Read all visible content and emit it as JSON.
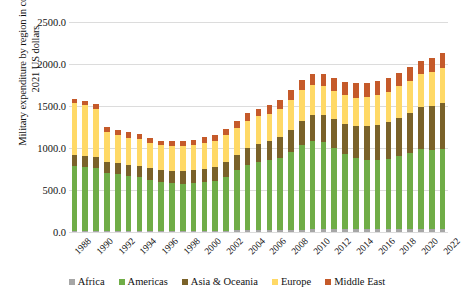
{
  "chart_data": {
    "type": "bar",
    "subtype": "stacked-column",
    "title": "",
    "xlabel": "",
    "ylabel": "Military expenditure by region in constant 2021 US dollars",
    "ylabel_lines": [
      "Military expenditure by region in constant",
      "2021 US dollars"
    ],
    "ylim": [
      0,
      2500
    ],
    "ytick_values": [
      0,
      500,
      1000,
      1500,
      2000,
      2500
    ],
    "ytick_labels": [
      "0.0",
      "500.0",
      "1000.0",
      "1500.0",
      "2000.0",
      "2500.0"
    ],
    "grid": true,
    "legend_position": "bottom",
    "categories": [
      "1988",
      "1989",
      "1990",
      "1991",
      "1992",
      "1993",
      "1994",
      "1995",
      "1996",
      "1997",
      "1998",
      "1999",
      "2000",
      "2001",
      "2002",
      "2003",
      "2004",
      "2005",
      "2006",
      "2007",
      "2008",
      "2009",
      "2010",
      "2011",
      "2012",
      "2013",
      "2014",
      "2015",
      "2016",
      "2017",
      "2018",
      "2019",
      "2020",
      "2021",
      "2022"
    ],
    "xtick_labels": [
      "1988",
      "1990",
      "1992",
      "1994",
      "1996",
      "1998",
      "2000",
      "2002",
      "2004",
      "2006",
      "2008",
      "2010",
      "2012",
      "2014",
      "2016",
      "2018",
      "2020",
      "2022"
    ],
    "series": [
      {
        "name": "Africa",
        "color": "#a6a6a6",
        "values": [
          18,
          18,
          18,
          17,
          16,
          15,
          15,
          15,
          14,
          14,
          15,
          16,
          17,
          17,
          18,
          19,
          20,
          21,
          22,
          24,
          26,
          28,
          30,
          31,
          32,
          33,
          35,
          34,
          33,
          32,
          32,
          33,
          34,
          35,
          36
        ]
      },
      {
        "name": "Americas",
        "color": "#70ad47",
        "values": [
          770,
          760,
          745,
          690,
          680,
          655,
          640,
          610,
          580,
          570,
          560,
          565,
          575,
          585,
          640,
          715,
          780,
          815,
          830,
          860,
          930,
          1010,
          1055,
          1040,
          970,
          900,
          850,
          825,
          825,
          835,
          870,
          905,
          950,
          940,
          955
        ]
      },
      {
        "name": "Asia & Oceania",
        "color": "#7a6229",
        "values": [
          128,
          128,
          130,
          126,
          128,
          131,
          133,
          136,
          139,
          143,
          147,
          152,
          160,
          168,
          178,
          188,
          200,
          212,
          227,
          243,
          263,
          287,
          305,
          322,
          340,
          358,
          378,
          398,
          420,
          440,
          460,
          478,
          500,
          520,
          540
        ]
      },
      {
        "name": "Europe",
        "color": "#ffd966",
        "values": [
          620,
          608,
          570,
          355,
          330,
          322,
          320,
          300,
          298,
          300,
          300,
          305,
          310,
          312,
          318,
          322,
          326,
          328,
          332,
          340,
          352,
          362,
          356,
          348,
          342,
          338,
          338,
          345,
          352,
          362,
          372,
          386,
          400,
          408,
          425
        ]
      },
      {
        "name": "Middle East",
        "color": "#c55a2a",
        "values": [
          42,
          44,
          60,
          68,
          64,
          62,
          62,
          60,
          58,
          62,
          64,
          62,
          68,
          72,
          76,
          80,
          86,
          92,
          100,
          108,
          118,
          128,
          136,
          142,
          150,
          158,
          168,
          178,
          170,
          162,
          158,
          160,
          158,
          165,
          175
        ]
      }
    ],
    "legend_entries": [
      {
        "label": "Africa",
        "color": "#a6a6a6"
      },
      {
        "label": "Americas",
        "color": "#70ad47"
      },
      {
        "label": "Asia & Oceania",
        "color": "#7a6229"
      },
      {
        "label": "Europe",
        "color": "#ffd966"
      },
      {
        "label": "Middle East",
        "color": "#c55a2a"
      }
    ]
  }
}
